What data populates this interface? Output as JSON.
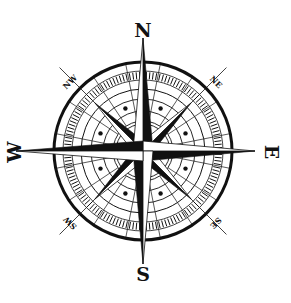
{
  "figure": {
    "center": [
      143,
      151
    ],
    "colors": {
      "ink": "#111111",
      "background": "#ffffff"
    }
  },
  "cardinals": {
    "north": "N",
    "east": "E",
    "south": "S",
    "west": "W"
  },
  "intercardinals": {
    "northeast": "NE",
    "southeast": "SE",
    "southwest": "SW",
    "northwest": "NW"
  },
  "rings": {
    "outer_radius": 89,
    "tick_band": [
      71,
      80
    ],
    "tick_count": 144,
    "inner_radii": [
      62,
      52,
      40,
      30,
      27
    ],
    "dot_count": 8,
    "dot_radius": 46
  }
}
